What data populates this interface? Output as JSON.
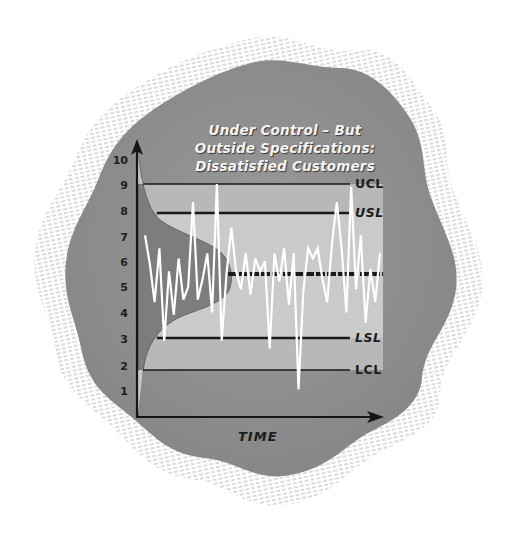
{
  "title": {
    "line1": "Under Control – But",
    "line2": "Outside Specifications:",
    "line3": "Dissatisfied Customers"
  },
  "axis": {
    "x_label": "TIME",
    "y_ticks": [
      "10",
      "9",
      "8",
      "7",
      "6",
      "5",
      "4",
      "3",
      "2",
      "1"
    ]
  },
  "limits": {
    "ucl": "UCL",
    "usl": "USL",
    "lsl": "LSL",
    "lcl": "LCL"
  },
  "colors": {
    "outer_bg": "#8c8c8c",
    "chart_band_light": "#c8c8c8",
    "chart_band_mid": "#a9a9a9",
    "distribution_fill": "#7a7a7a",
    "process_line": "#ffffff",
    "limit_line": "#1a1a1a",
    "hatch": "#b5b5b5"
  },
  "chart_data": {
    "type": "line",
    "title": "Under Control – But Outside Specifications: Dissatisfied Customers",
    "xlabel": "TIME",
    "ylabel": "",
    "ylim": [
      0,
      10
    ],
    "y_ticks": [
      1,
      2,
      3,
      4,
      5,
      6,
      7,
      8,
      9,
      10
    ],
    "grid": false,
    "legend": "none",
    "reference_lines": [
      {
        "name": "UCL",
        "value": 9.0,
        "style": "thin"
      },
      {
        "name": "USL",
        "value": 7.9,
        "style": "thick"
      },
      {
        "name": "Center",
        "value": 5.5,
        "style": "thick dashed"
      },
      {
        "name": "LSL",
        "value": 3.1,
        "style": "thick"
      },
      {
        "name": "LCL",
        "value": 1.9,
        "style": "thin"
      }
    ],
    "annotations": [
      "Normal distribution curve on y-axis centered at ~5.5, spread between LCL and UCL"
    ],
    "series": [
      {
        "name": "Process output",
        "x": [
          1,
          2,
          3,
          4,
          5,
          6,
          7,
          8,
          9,
          10,
          11,
          12,
          13,
          14,
          15,
          16,
          17,
          18,
          19,
          20,
          21,
          22,
          23,
          24,
          25,
          26,
          27,
          28,
          29,
          30,
          31,
          32,
          33,
          34,
          35,
          36,
          37,
          38,
          39,
          40,
          41,
          42,
          43,
          44,
          45,
          46,
          47,
          48,
          49,
          50
        ],
        "values": [
          7.1,
          6.0,
          4.5,
          6.6,
          3.0,
          5.7,
          4.0,
          6.2,
          4.6,
          5.1,
          8.4,
          4.6,
          5.4,
          6.4,
          4.1,
          9.1,
          3.0,
          5.6,
          7.4,
          5.7,
          5.0,
          6.4,
          4.8,
          6.2,
          5.7,
          6.1,
          2.7,
          6.4,
          5.3,
          6.6,
          4.4,
          6.4,
          1.1,
          4.9,
          6.6,
          6.2,
          6.6,
          5.4,
          4.5,
          6.8,
          8.4,
          6.6,
          4.1,
          9.0,
          5.0,
          7.1,
          3.7,
          5.8,
          4.5,
          6.4
        ]
      }
    ]
  }
}
